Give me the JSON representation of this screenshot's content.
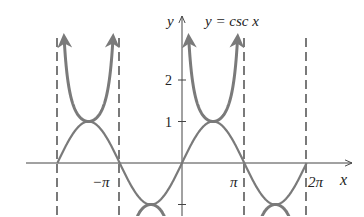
{
  "chart_data": {
    "type": "line",
    "title": "y = csc x",
    "xlabel": "x",
    "ylabel": "y",
    "xlim": [
      -6.8,
      6.9
    ],
    "ylim": [
      -1.3,
      3.5
    ],
    "grid": false,
    "legend": null,
    "x_ticks": [
      {
        "value": -3.14159,
        "label": "−π"
      },
      {
        "value": 3.14159,
        "label": "π"
      },
      {
        "value": 6.28319,
        "label": "2π"
      }
    ],
    "y_ticks": [
      {
        "value": 1,
        "label": "1"
      },
      {
        "value": 2,
        "label": "2"
      }
    ],
    "asymptotes_x": [
      -6.28319,
      -3.14159,
      3.14159,
      6.28319
    ],
    "series": [
      {
        "name": "y = csc x",
        "function": "csc(x)",
        "domain": [
          -6.28319,
          6.28319
        ],
        "color": "#777777",
        "style": "solid thick, arrowheads at ends",
        "local_mins": [
          [
            -4.712,
            1
          ],
          [
            1.5708,
            1
          ]
        ],
        "local_maxs": [
          [
            -1.5708,
            -1
          ],
          [
            4.712,
            -1
          ]
        ]
      },
      {
        "name": "y = sin x",
        "function": "sin(x)",
        "domain": [
          -6.28319,
          6.28319
        ],
        "color": "#777777",
        "style": "solid"
      }
    ]
  },
  "labels": {
    "y_axis": "y",
    "x_axis": "x",
    "curve": "y = csc x",
    "tick_2": "2",
    "tick_1": "1",
    "tick_neg_pi": "−π",
    "tick_pi": "π",
    "tick_2pi": "2π"
  },
  "colors": {
    "curve": "#7a7a7a",
    "axis": "#444444",
    "asymptote": "#333333"
  }
}
